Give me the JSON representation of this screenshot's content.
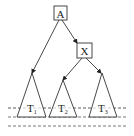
{
  "diagram": {
    "type": "tree",
    "nodes": [
      {
        "id": "A",
        "label": "A",
        "shape": "box"
      },
      {
        "id": "X",
        "label": "X",
        "shape": "box"
      }
    ],
    "subtrees": [
      {
        "id": "T1",
        "label": "T",
        "subscript": "1"
      },
      {
        "id": "T2",
        "label": "T",
        "subscript": "2"
      },
      {
        "id": "T3",
        "label": "T",
        "subscript": "3"
      }
    ],
    "edges": [
      {
        "from": "A",
        "to": "T1"
      },
      {
        "from": "A",
        "to": "X"
      },
      {
        "from": "X",
        "to": "T2"
      },
      {
        "from": "X",
        "to": "T3"
      }
    ],
    "level_lines": 3
  }
}
